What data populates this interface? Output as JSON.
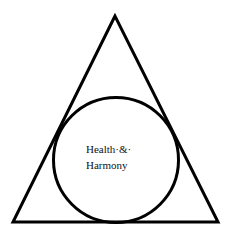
{
  "diagram": {
    "shapes": {
      "triangle": {
        "points": [
          [
            115,
            16
          ],
          [
            13,
            222
          ],
          [
            218,
            222
          ]
        ],
        "stroke": "#000000",
        "stroke_width": 3
      },
      "circle": {
        "cx": 116,
        "cy": 160,
        "r": 63,
        "stroke": "#000000",
        "stroke_width": 3
      }
    },
    "label": {
      "line1": "Health·&·",
      "line2": "Harmony"
    }
  }
}
